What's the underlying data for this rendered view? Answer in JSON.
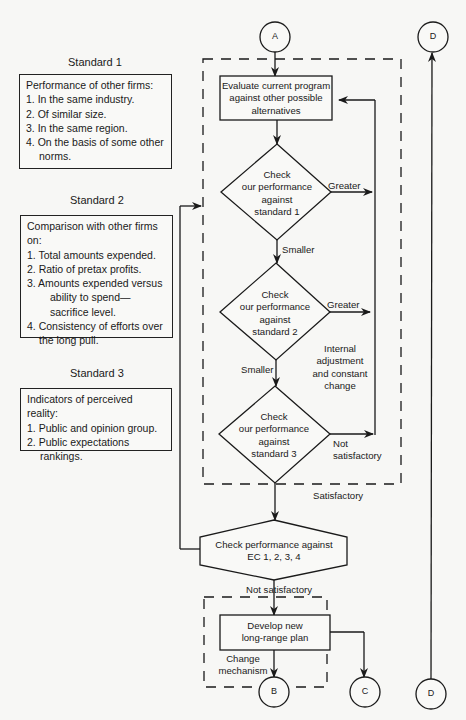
{
  "standards": [
    {
      "title": "Standard 1",
      "heading": "Performance of other firms:",
      "items": [
        "1. In the same industry.",
        "2. Of similar size.",
        "3. In the same region.",
        "4. On the basis of some other",
        "norms."
      ]
    },
    {
      "title": "Standard 2",
      "heading": "Comparison with other firms on:",
      "items": [
        "1. Total amounts expended.",
        "2. Ratio of pretax profits.",
        "3. Amounts expended versus",
        "ability to spend—",
        "sacrifice level.",
        "4. Consistency of efforts over",
        "the long pull."
      ]
    },
    {
      "title": "Standard 3",
      "heading": "Indicators of perceived reality:",
      "items": [
        "1. Public and opinion group.",
        "2. Public expectations",
        "rankings."
      ]
    }
  ],
  "connectors": {
    "a": "A",
    "b": "B",
    "c": "C",
    "d_top": "D",
    "d_bottom": "D"
  },
  "nodes": {
    "evaluate": [
      "Evaluate current program",
      "against other possible",
      "alternatives"
    ],
    "check1": [
      "Check",
      "our performance",
      "against",
      "standard 1"
    ],
    "check2": [
      "Check",
      "our performance",
      "against",
      "standard 2"
    ],
    "check3": [
      "Check",
      "our performance",
      "against",
      "standard 3"
    ],
    "check_ec": [
      "Check performance against",
      "EC 1, 2, 3, 4"
    ],
    "develop": [
      "Develop new",
      "long-range plan"
    ]
  },
  "edge_labels": {
    "greater1": "Greater",
    "smaller1": "Smaller",
    "greater2": "Greater",
    "smaller2": "Smaller",
    "internal": [
      "Internal",
      "adjustment",
      "and constant",
      "change"
    ],
    "not_satisfactory3": [
      "Not",
      "satisfactory"
    ],
    "satisfactory": "Satisfactory",
    "not_satisfactory_ec": "Not satisfactory",
    "change_mechanism": [
      "Change",
      "mechanism"
    ]
  }
}
